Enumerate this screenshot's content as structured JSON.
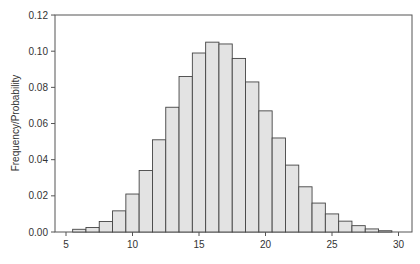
{
  "chart_data": {
    "type": "bar",
    "subtype": "histogram",
    "title": "",
    "xlabel": "",
    "ylabel": "Frequency/Probability",
    "xlim": [
      4.2,
      31.8
    ],
    "ylim": [
      0,
      0.12
    ],
    "x_ticks": [
      5,
      10,
      15,
      20,
      25,
      30
    ],
    "y_ticks": [
      0.0,
      0.02,
      0.04,
      0.06,
      0.08,
      0.1,
      0.12
    ],
    "y_tick_labels": [
      "0.00",
      "0.02",
      "0.04",
      "0.06",
      "0.08",
      "0.10",
      "0.12"
    ],
    "x_tick_labels": [
      "5",
      "10",
      "15",
      "20",
      "25",
      "30"
    ],
    "bin_width": 1,
    "categories": [
      6,
      7,
      8,
      9,
      10,
      11,
      12,
      13,
      14,
      15,
      16,
      17,
      18,
      19,
      20,
      21,
      22,
      23,
      24,
      25,
      26,
      27,
      28,
      29
    ],
    "values": [
      0.0015,
      0.0025,
      0.0058,
      0.0117,
      0.021,
      0.034,
      0.051,
      0.069,
      0.086,
      0.099,
      0.105,
      0.104,
      0.096,
      0.083,
      0.067,
      0.052,
      0.037,
      0.025,
      0.016,
      0.01,
      0.006,
      0.0035,
      0.0017,
      0.0007
    ],
    "grid": false,
    "legend": null,
    "colors": {
      "bar_fill": "#e3e3e3",
      "bar_edge": "#444444",
      "axis": "#555555",
      "text": "#333333"
    }
  }
}
